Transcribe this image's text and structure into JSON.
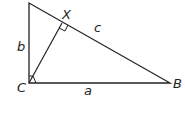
{
  "diagram": {
    "type": "right-triangle-with-altitude",
    "vertices": {
      "A": {
        "label": "",
        "x": 29,
        "y": 3
      },
      "C": {
        "label": "C",
        "x": 29,
        "y": 83
      },
      "B": {
        "label": "B",
        "x": 170,
        "y": 83
      },
      "X": {
        "label": "X",
        "x": 62,
        "y": 23
      }
    },
    "sides": {
      "a": {
        "label": "a"
      },
      "b": {
        "label": "b"
      },
      "c": {
        "label": "c"
      }
    },
    "right_angles": [
      "C",
      "X"
    ],
    "stroke_color": "#222222"
  }
}
